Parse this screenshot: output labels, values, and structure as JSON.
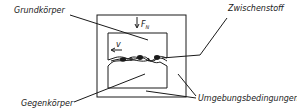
{
  "diagram": {
    "title": "",
    "labels": {
      "grundkoerper": "Grundkörper",
      "zwischenstoff": "Zwischenstoff",
      "gegenkoerper": "Gegenkörper",
      "umgebungsbedingungen": "Umgebungsbedingungen"
    },
    "symbols": {
      "normal_force": "F",
      "normal_force_subscript": "N",
      "velocity": "v"
    },
    "colors": {
      "ink": "#1a1a1a",
      "background": "#ffffff"
    }
  }
}
